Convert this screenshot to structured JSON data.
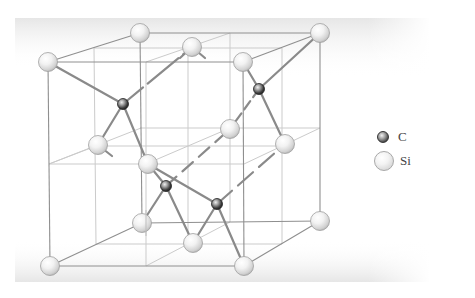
{
  "diagram": {
    "colors": {
      "background": "#ffffff",
      "gradient_band": "#ececec",
      "cube_edge": "#8c8c8c",
      "grid_line": "#c8c8c8",
      "bond": "#8a8a8a",
      "si_fill": "#f4f4f4",
      "c_fill": "#3a3a3a"
    },
    "cube": {
      "front": {
        "tl": [
          48,
          62
        ],
        "tr": [
          243,
          62
        ],
        "br": [
          244,
          266
        ],
        "bl": [
          50,
          266
        ]
      },
      "back": {
        "tl": [
          140,
          33
        ],
        "tr": [
          320,
          33
        ],
        "br": [
          320,
          221
        ],
        "bl": [
          142,
          223
        ]
      }
    },
    "atoms": {
      "Si": [
        {
          "id": "si-front-tl",
          "x": 48,
          "y": 62
        },
        {
          "id": "si-front-tr",
          "x": 243,
          "y": 62
        },
        {
          "id": "si-front-bl",
          "x": 50,
          "y": 266
        },
        {
          "id": "si-front-br",
          "x": 244,
          "y": 266
        },
        {
          "id": "si-back-tl",
          "x": 140,
          "y": 33
        },
        {
          "id": "si-back-tr",
          "x": 320,
          "y": 33
        },
        {
          "id": "si-back-br",
          "x": 320,
          "y": 221
        },
        {
          "id": "si-back-bl",
          "x": 142,
          "y": 223
        },
        {
          "id": "si-top-center",
          "x": 192,
          "y": 47
        },
        {
          "id": "si-left-center",
          "x": 98,
          "y": 145
        },
        {
          "id": "si-back-center",
          "x": 230,
          "y": 129
        },
        {
          "id": "si-right-center",
          "x": 285,
          "y": 144
        },
        {
          "id": "si-front-center",
          "x": 148,
          "y": 164
        },
        {
          "id": "si-bottom-center",
          "x": 193,
          "y": 243
        }
      ],
      "C": [
        {
          "id": "c-1",
          "x": 123,
          "y": 104
        },
        {
          "id": "c-2",
          "x": 259,
          "y": 89
        },
        {
          "id": "c-3",
          "x": 166,
          "y": 186
        },
        {
          "id": "c-4",
          "x": 217,
          "y": 204
        }
      ]
    }
  },
  "legend": {
    "items": [
      {
        "symbol": "C",
        "label": "C"
      },
      {
        "symbol": "Si",
        "label": "Si"
      }
    ]
  }
}
